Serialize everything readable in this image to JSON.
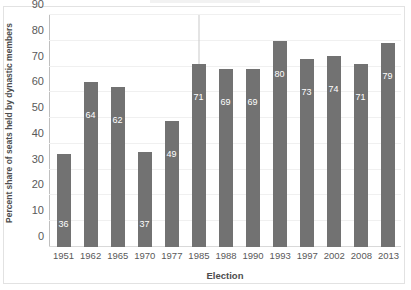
{
  "chart_data": {
    "type": "bar",
    "title": "",
    "xlabel": "Election",
    "ylabel": "Percent share of seats held by dynastic members",
    "categories": [
      "1951",
      "1962",
      "1965",
      "1970",
      "1977",
      "1985",
      "1988",
      "1990",
      "1993",
      "1997",
      "2002",
      "2008",
      "2013"
    ],
    "values": [
      36,
      64,
      62,
      37,
      49,
      71,
      69,
      69,
      80,
      73,
      74,
      71,
      79
    ],
    "data_labels": [
      "36",
      "64",
      "62",
      "37",
      "49",
      "71",
      "69",
      "69",
      "80",
      "73",
      "74",
      "71",
      "79"
    ],
    "ylim": [
      0,
      90
    ],
    "yticks": [
      "0",
      "10",
      "20",
      "30",
      "40",
      "50",
      "60",
      "70",
      "80",
      "90"
    ],
    "ytick_values": [
      0,
      10,
      20,
      30,
      40,
      50,
      60,
      70,
      80,
      90
    ],
    "grid": true,
    "legend": null,
    "annotations": [
      {
        "category": "1985",
        "kind": "error-bar",
        "upper": 90,
        "lower": 71
      }
    ],
    "bar_color": "#727272",
    "label_color": "#ffffff",
    "gridline_color": "#f0f0f0",
    "axis_color": "#d9d9d9"
  }
}
